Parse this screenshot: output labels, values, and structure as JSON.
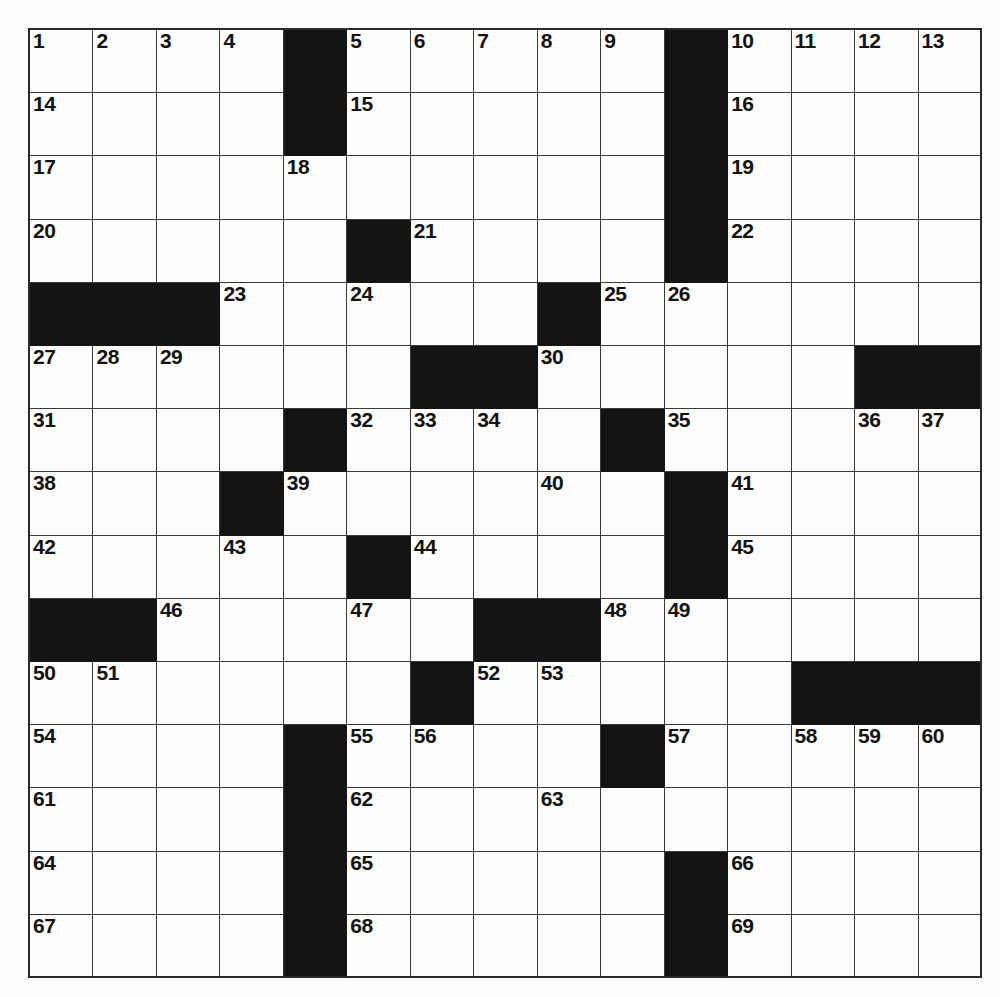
{
  "puzzle": {
    "title": "Crossword Puzzle Grid",
    "rows": 15,
    "cols": 15,
    "colors": {
      "block": "#141414",
      "open": "#fdfdfb",
      "border": "#2b2b2b",
      "number": "#121212",
      "page_background": "#fdfdfc"
    },
    "grid": [
      [
        "W",
        "W",
        "W",
        "W",
        "B",
        "W",
        "W",
        "W",
        "W",
        "W",
        "B",
        "W",
        "W",
        "W",
        "W"
      ],
      [
        "W",
        "W",
        "W",
        "W",
        "B",
        "W",
        "W",
        "W",
        "W",
        "W",
        "B",
        "W",
        "W",
        "W",
        "W"
      ],
      [
        "W",
        "W",
        "W",
        "W",
        "W",
        "W",
        "W",
        "W",
        "W",
        "W",
        "B",
        "W",
        "W",
        "W",
        "W"
      ],
      [
        "W",
        "W",
        "W",
        "W",
        "W",
        "B",
        "W",
        "W",
        "W",
        "W",
        "B",
        "W",
        "W",
        "W",
        "W"
      ],
      [
        "B",
        "B",
        "B",
        "W",
        "W",
        "W",
        "W",
        "W",
        "B",
        "W",
        "W",
        "W",
        "W",
        "W",
        "W"
      ],
      [
        "W",
        "W",
        "W",
        "W",
        "W",
        "W",
        "B",
        "B",
        "W",
        "W",
        "W",
        "W",
        "W",
        "B",
        "B"
      ],
      [
        "W",
        "W",
        "W",
        "W",
        "B",
        "W",
        "W",
        "W",
        "W",
        "B",
        "W",
        "W",
        "W",
        "W",
        "W"
      ],
      [
        "W",
        "W",
        "W",
        "B",
        "W",
        "W",
        "W",
        "W",
        "W",
        "W",
        "B",
        "W",
        "W",
        "W",
        "W"
      ],
      [
        "W",
        "W",
        "W",
        "W",
        "W",
        "B",
        "W",
        "W",
        "W",
        "W",
        "B",
        "W",
        "W",
        "W",
        "W"
      ],
      [
        "B",
        "B",
        "W",
        "W",
        "W",
        "W",
        "W",
        "B",
        "B",
        "W",
        "W",
        "W",
        "W",
        "W",
        "W"
      ],
      [
        "W",
        "W",
        "W",
        "W",
        "W",
        "W",
        "B",
        "W",
        "W",
        "W",
        "W",
        "W",
        "B",
        "B",
        "B"
      ],
      [
        "W",
        "W",
        "W",
        "W",
        "B",
        "W",
        "W",
        "W",
        "W",
        "B",
        "W",
        "W",
        "W",
        "W",
        "W"
      ],
      [
        "W",
        "W",
        "W",
        "W",
        "B",
        "W",
        "W",
        "W",
        "W",
        "W",
        "W",
        "W",
        "W",
        "W",
        "W"
      ],
      [
        "W",
        "W",
        "W",
        "W",
        "B",
        "W",
        "W",
        "W",
        "W",
        "W",
        "B",
        "W",
        "W",
        "W",
        "W"
      ],
      [
        "W",
        "W",
        "W",
        "W",
        "B",
        "W",
        "W",
        "W",
        "W",
        "W",
        "B",
        "W",
        "W",
        "W",
        "W"
      ]
    ],
    "numbers": [
      {
        "row": 0,
        "col": 0,
        "label": "1"
      },
      {
        "row": 0,
        "col": 1,
        "label": "2"
      },
      {
        "row": 0,
        "col": 2,
        "label": "3"
      },
      {
        "row": 0,
        "col": 3,
        "label": "4"
      },
      {
        "row": 0,
        "col": 5,
        "label": "5"
      },
      {
        "row": 0,
        "col": 6,
        "label": "6"
      },
      {
        "row": 0,
        "col": 7,
        "label": "7"
      },
      {
        "row": 0,
        "col": 8,
        "label": "8"
      },
      {
        "row": 0,
        "col": 9,
        "label": "9"
      },
      {
        "row": 0,
        "col": 11,
        "label": "10"
      },
      {
        "row": 0,
        "col": 12,
        "label": "11"
      },
      {
        "row": 0,
        "col": 13,
        "label": "12"
      },
      {
        "row": 0,
        "col": 14,
        "label": "13"
      },
      {
        "row": 1,
        "col": 0,
        "label": "14"
      },
      {
        "row": 1,
        "col": 5,
        "label": "15"
      },
      {
        "row": 1,
        "col": 11,
        "label": "16"
      },
      {
        "row": 2,
        "col": 0,
        "label": "17"
      },
      {
        "row": 2,
        "col": 4,
        "label": "18"
      },
      {
        "row": 2,
        "col": 11,
        "label": "19"
      },
      {
        "row": 3,
        "col": 0,
        "label": "20"
      },
      {
        "row": 3,
        "col": 6,
        "label": "21"
      },
      {
        "row": 3,
        "col": 11,
        "label": "22"
      },
      {
        "row": 4,
        "col": 3,
        "label": "23"
      },
      {
        "row": 4,
        "col": 5,
        "label": "24"
      },
      {
        "row": 4,
        "col": 9,
        "label": "25"
      },
      {
        "row": 4,
        "col": 10,
        "label": "26"
      },
      {
        "row": 5,
        "col": 0,
        "label": "27"
      },
      {
        "row": 5,
        "col": 1,
        "label": "28"
      },
      {
        "row": 5,
        "col": 2,
        "label": "29"
      },
      {
        "row": 5,
        "col": 8,
        "label": "30"
      },
      {
        "row": 6,
        "col": 0,
        "label": "31"
      },
      {
        "row": 6,
        "col": 5,
        "label": "32"
      },
      {
        "row": 6,
        "col": 6,
        "label": "33"
      },
      {
        "row": 6,
        "col": 7,
        "label": "34"
      },
      {
        "row": 6,
        "col": 10,
        "label": "35"
      },
      {
        "row": 6,
        "col": 13,
        "label": "36"
      },
      {
        "row": 6,
        "col": 14,
        "label": "37"
      },
      {
        "row": 7,
        "col": 0,
        "label": "38"
      },
      {
        "row": 7,
        "col": 4,
        "label": "39"
      },
      {
        "row": 7,
        "col": 8,
        "label": "40"
      },
      {
        "row": 7,
        "col": 11,
        "label": "41"
      },
      {
        "row": 8,
        "col": 0,
        "label": "42"
      },
      {
        "row": 8,
        "col": 3,
        "label": "43"
      },
      {
        "row": 8,
        "col": 6,
        "label": "44"
      },
      {
        "row": 8,
        "col": 11,
        "label": "45"
      },
      {
        "row": 9,
        "col": 2,
        "label": "46"
      },
      {
        "row": 9,
        "col": 5,
        "label": "47"
      },
      {
        "row": 9,
        "col": 9,
        "label": "48"
      },
      {
        "row": 9,
        "col": 10,
        "label": "49"
      },
      {
        "row": 10,
        "col": 0,
        "label": "50"
      },
      {
        "row": 10,
        "col": 1,
        "label": "51"
      },
      {
        "row": 10,
        "col": 7,
        "label": "52"
      },
      {
        "row": 10,
        "col": 8,
        "label": "53"
      },
      {
        "row": 11,
        "col": 0,
        "label": "54"
      },
      {
        "row": 11,
        "col": 5,
        "label": "55"
      },
      {
        "row": 11,
        "col": 6,
        "label": "56"
      },
      {
        "row": 11,
        "col": 10,
        "label": "57"
      },
      {
        "row": 11,
        "col": 12,
        "label": "58"
      },
      {
        "row": 11,
        "col": 13,
        "label": "59"
      },
      {
        "row": 11,
        "col": 14,
        "label": "60"
      },
      {
        "row": 12,
        "col": 0,
        "label": "61"
      },
      {
        "row": 12,
        "col": 5,
        "label": "62"
      },
      {
        "row": 12,
        "col": 8,
        "label": "63"
      },
      {
        "row": 13,
        "col": 0,
        "label": "64"
      },
      {
        "row": 13,
        "col": 5,
        "label": "65"
      },
      {
        "row": 13,
        "col": 11,
        "label": "66"
      },
      {
        "row": 14,
        "col": 0,
        "label": "67"
      },
      {
        "row": 14,
        "col": 5,
        "label": "68"
      },
      {
        "row": 14,
        "col": 11,
        "label": "69"
      }
    ],
    "entries": {}
  }
}
